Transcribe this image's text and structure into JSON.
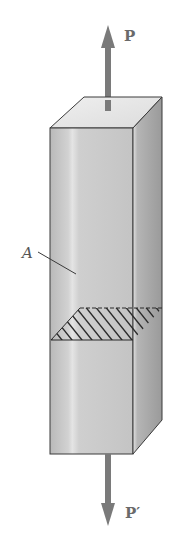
{
  "figure": {
    "labels": {
      "top_force": "P",
      "bottom_force": "P′",
      "area": "A"
    },
    "colors": {
      "arrow": "#7a7a7a",
      "front_face_light": "#d6d6d6",
      "front_face_dark": "#b0b0b0",
      "side_face": "#a8a8a8",
      "top_face": "#e6e6e6",
      "edge": "#3a3a3a",
      "hatch": "#2a2a2a"
    }
  }
}
